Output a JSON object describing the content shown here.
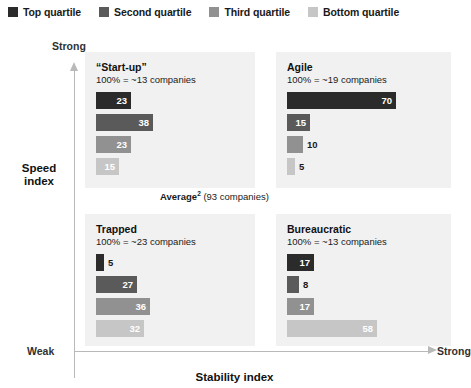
{
  "legend": {
    "items": [
      {
        "label": "Top quartile",
        "color": "#2b2b2b"
      },
      {
        "label": "Second quartile",
        "color": "#5a5a5a"
      },
      {
        "label": "Third quartile",
        "color": "#919191"
      },
      {
        "label": "Bottom quartile",
        "color": "#c6c6c6"
      }
    ]
  },
  "axes": {
    "y_title": "Speed\nindex",
    "y_title_line1": "Speed",
    "y_title_line2": "index",
    "y_high_label": "Strong",
    "x_title": "Stability index",
    "x_low_label": "Weak",
    "x_high_label": "Strong"
  },
  "annotation": {
    "average_word": "Average",
    "average_superscript": "2",
    "average_detail": "(93 companies)"
  },
  "quadrants": [
    {
      "id": "startup",
      "title": "“Start-up”",
      "subtitle": "100% = ~13 companies",
      "values": [
        23,
        38,
        23,
        15
      ]
    },
    {
      "id": "agile",
      "title": "Agile",
      "subtitle": "100% = ~19 companies",
      "values": [
        70,
        15,
        10,
        5
      ]
    },
    {
      "id": "trapped",
      "title": "Trapped",
      "subtitle": "100% = ~23 companies",
      "values": [
        5,
        27,
        36,
        32
      ]
    },
    {
      "id": "bureaucratic",
      "title": "Bureaucratic",
      "subtitle": "100% = ~13 companies",
      "values": [
        17,
        8,
        17,
        58
      ]
    }
  ],
  "chart_data": {
    "type": "bar",
    "xlabel": "Stability index",
    "ylabel": "Speed index",
    "xlim": [
      0,
      100
    ],
    "grid": false,
    "legend_position": "top",
    "categories": [
      "Top quartile",
      "Second quartile",
      "Third quartile",
      "Bottom quartile"
    ],
    "series": [
      {
        "name": "“Start-up”",
        "values": [
          23,
          38,
          23,
          15
        ],
        "n": "~13 companies",
        "quadrant": "high-speed / weak-stability"
      },
      {
        "name": "Agile",
        "values": [
          70,
          15,
          10,
          5
        ],
        "n": "~19 companies",
        "quadrant": "high-speed / strong-stability"
      },
      {
        "name": "Trapped",
        "values": [
          5,
          27,
          36,
          32
        ],
        "n": "~23 companies",
        "quadrant": "low-speed / weak-stability"
      },
      {
        "name": "Bureaucratic",
        "values": [
          17,
          8,
          17,
          58
        ],
        "n": "~13 companies",
        "quadrant": "low-speed / strong-stability"
      }
    ],
    "annotations": [
      "Average2 (93 companies)"
    ],
    "units": "percent"
  }
}
